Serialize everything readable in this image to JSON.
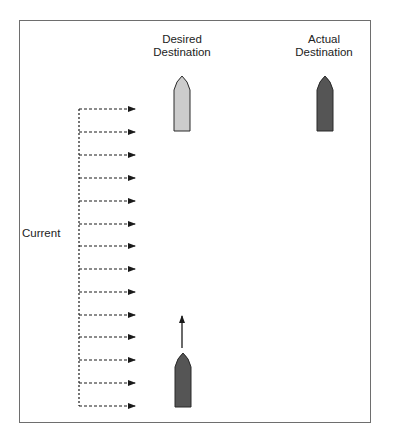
{
  "diagram": {
    "labels": {
      "desired_line1": "Desired",
      "desired_line2": "Destination",
      "actual_line1": "Actual",
      "actual_line2": "Destination",
      "current": "Current"
    },
    "colors": {
      "frame": "#6e6e6e",
      "desired_boat_fill": "#cccccc",
      "actual_boat_fill": "#555555",
      "start_boat_fill": "#555555",
      "arrow": "#1a1a1a"
    },
    "current_arrows": {
      "count": 14,
      "y_positions": [
        109,
        132,
        155,
        178,
        201,
        224,
        246,
        269,
        292,
        315,
        337,
        360,
        383,
        406
      ]
    }
  }
}
